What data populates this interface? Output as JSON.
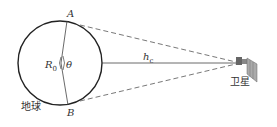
{
  "diagram": {
    "labels": {
      "point_a": "A",
      "point_b": "B",
      "radius": "R",
      "radius_sub": "0",
      "angle": "θ",
      "height": "h",
      "height_sub": "c",
      "earth": "地球",
      "satellite": "卫星"
    },
    "colors": {
      "line": "#333333",
      "background": "#ffffff"
    }
  }
}
